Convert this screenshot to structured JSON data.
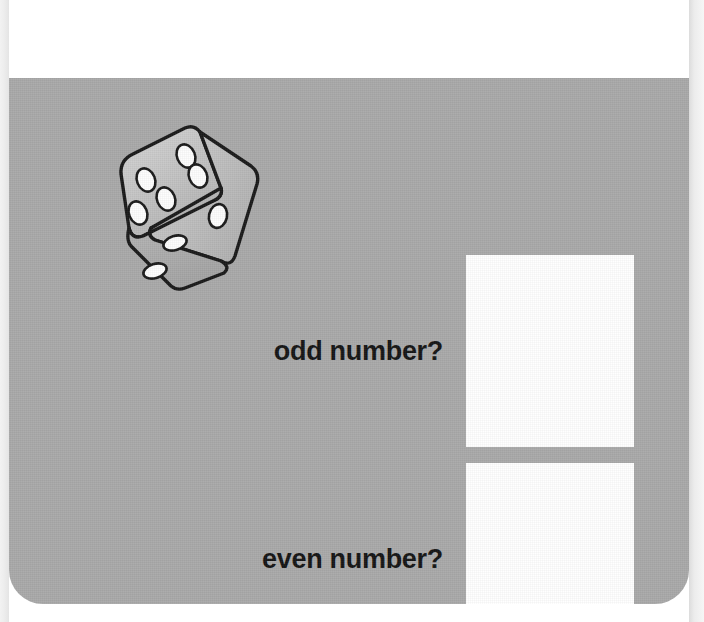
{
  "worksheet": {
    "background_color": "#a9a9a9",
    "page_color": "#ffffff",
    "answer_box_color": "#ffffff"
  },
  "illustration": {
    "name": "dice-illustration",
    "alt": "three-dimensional die",
    "faces": [
      {
        "name": "top-left-face",
        "pips": 5
      },
      {
        "name": "right-face",
        "pips": 1
      },
      {
        "name": "bottom-face",
        "pips": 2
      }
    ]
  },
  "questions": [
    {
      "label": "odd number?",
      "answer": ""
    },
    {
      "label": "even number?",
      "answer": ""
    }
  ]
}
